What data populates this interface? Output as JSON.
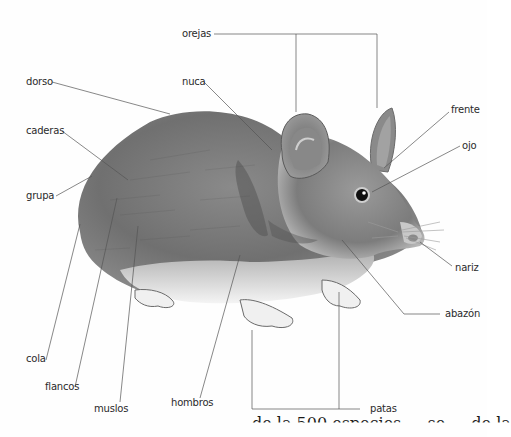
{
  "diagram": {
    "labels": {
      "orejas": "orejas",
      "dorso": "dorso",
      "nuca": "nuca",
      "caderas": "caderas",
      "frente": "frente",
      "ojo": "ojo",
      "grupa": "grupa",
      "nariz": "nariz",
      "abazon": "abazón",
      "cola": "cola",
      "flancos": "flancos",
      "muslos": "muslos",
      "hombros": "hombros",
      "patas": "patas"
    },
    "caption_fragment": "de la 500 especies … se … de la",
    "colors": {
      "leader_line": "#555555",
      "label_text": "#2a2a2a",
      "fur_dark": "#6e6e6e",
      "fur_light": "#f2f2f2"
    }
  }
}
